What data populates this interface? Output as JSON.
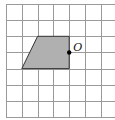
{
  "figure": {
    "grid": {
      "columns": 7,
      "rows": 7,
      "line_color": "#9a9a9a"
    },
    "shape": {
      "type": "trapezoid",
      "fill_color": "#b0b0b0",
      "vertices_grid_units": [
        [
          2,
          2
        ],
        [
          4,
          2
        ],
        [
          4,
          4
        ],
        [
          1,
          4
        ]
      ]
    },
    "point": {
      "label": "O",
      "position_grid_units": [
        4,
        3
      ]
    }
  }
}
